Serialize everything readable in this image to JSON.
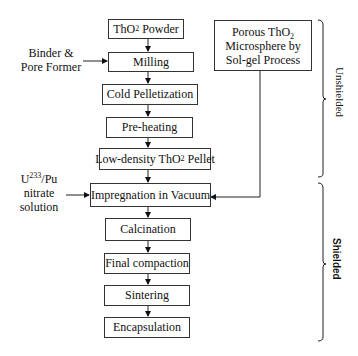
{
  "diagram": {
    "main_steps": [
      {
        "label": "ThO",
        "sub": "2",
        "after": " Powder"
      },
      {
        "label": "Milling"
      },
      {
        "label": "Cold Pelletization"
      },
      {
        "label": "Pre-heating"
      },
      {
        "label": "Low-density ThO",
        "sub": "2",
        "after": " Pellet"
      },
      {
        "label": "Impregnation in Vacuum"
      },
      {
        "label": "Calcination"
      },
      {
        "label": "Final compaction"
      },
      {
        "label": "Sintering"
      },
      {
        "label": "Encapsulation"
      }
    ],
    "side_box": {
      "line1": "Porous ThO",
      "sub": "2",
      "line2": "Microsphere by",
      "line3": "Sol-gel Process"
    },
    "inputs": {
      "binder": {
        "line1": "Binder &",
        "line2": "Pore Former"
      },
      "nitrate": {
        "line1a": "U",
        "sup": "233",
        "line1b": "/Pu",
        "line2": "nitrate",
        "line3": "solution"
      }
    },
    "zones": {
      "unshielded": "Unshielded",
      "shielded": "Shielded"
    }
  }
}
